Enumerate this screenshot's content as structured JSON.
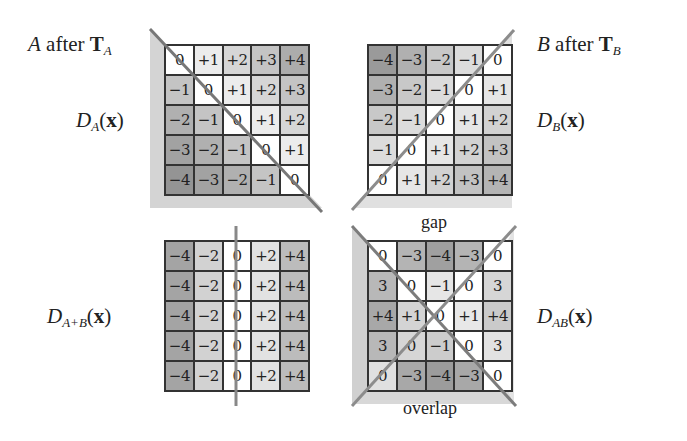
{
  "labels": {
    "a_title_var": "A",
    "a_title_text": " after ",
    "a_title_T": "T",
    "a_title_sub": "A",
    "b_title_var": "B",
    "b_title_text": " after ",
    "b_title_T": "T",
    "b_title_sub": "B",
    "da_D": "D",
    "da_sub": "A",
    "da_arg_open": "(",
    "da_arg": "x",
    "da_arg_close": ")",
    "db_D": "D",
    "db_sub": "B",
    "db_arg_open": "(",
    "db_arg": "x",
    "db_arg_close": ")",
    "dapb_D": "D",
    "dapb_sub": "A+B",
    "dapb_arg_open": "(",
    "dapb_arg": "x",
    "dapb_arg_close": ")",
    "dab_D": "D",
    "dab_sub": "AB",
    "dab_arg_open": "(",
    "dab_arg": "x",
    "dab_arg_close": ")",
    "gap": "gap",
    "overlap": "overlap"
  },
  "grids": {
    "A": [
      [
        "0",
        "+1",
        "+2",
        "+3",
        "+4"
      ],
      [
        "−1",
        "0",
        "+1",
        "+2",
        "+3"
      ],
      [
        "−2",
        "−1",
        "0",
        "+1",
        "+2"
      ],
      [
        "−3",
        "−2",
        "−1",
        "0",
        "+1"
      ],
      [
        "−4",
        "−3",
        "−2",
        "−1",
        "0"
      ]
    ],
    "B": [
      [
        "−4",
        "−3",
        "−2",
        "−1",
        "0"
      ],
      [
        "−3",
        "−2",
        "−1",
        "0",
        "+1"
      ],
      [
        "−2",
        "−1",
        "0",
        "+1",
        "+2"
      ],
      [
        "−1",
        "0",
        "+1",
        "+2",
        "+3"
      ],
      [
        "0",
        "+1",
        "+2",
        "+3",
        "+4"
      ]
    ],
    "AplusB": [
      [
        "−4",
        "−2",
        "0",
        "+2",
        "+4"
      ],
      [
        "−4",
        "−2",
        "0",
        "+2",
        "+4"
      ],
      [
        "−4",
        "−2",
        "0",
        "+2",
        "+4"
      ],
      [
        "−4",
        "−2",
        "0",
        "+2",
        "+4"
      ],
      [
        "−4",
        "−2",
        "0",
        "+2",
        "+4"
      ]
    ],
    "AB": [
      [
        "0",
        "−3",
        "−4",
        "−3",
        "0"
      ],
      [
        "3",
        "0",
        "−1",
        "0",
        "3"
      ],
      [
        "+4",
        "+1",
        "0",
        "+1",
        "+4"
      ],
      [
        "3",
        "0",
        "−1",
        "0",
        "3"
      ],
      [
        "0",
        "−3",
        "−4",
        "−3",
        "0"
      ]
    ]
  },
  "colors": {
    "shade_0": "#ffffff",
    "shade_1": "#e6e6e6",
    "shade_2": "#d2d2d2",
    "shade_3": "#bdbdbd",
    "shade_4": "#a8a8a8",
    "wedge": "#d6d6d6",
    "line": "#8a8a8a",
    "border": "#333333"
  }
}
